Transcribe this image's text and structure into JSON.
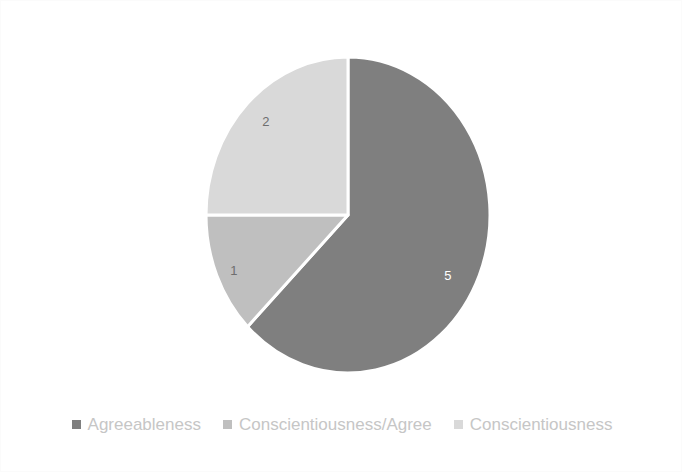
{
  "chart_data": {
    "type": "pie",
    "title": "",
    "categories": [
      "Agreeableness",
      "Conscientiousness/Agree",
      "Conscientiousness"
    ],
    "values": [
      5,
      1,
      2
    ],
    "labels": [
      "5",
      "1",
      "2"
    ],
    "total": 8,
    "start_angle_deg": 0,
    "direction": "clockwise",
    "slice_angles_deg": [
      225,
      45,
      90
    ],
    "colors": [
      "#7f7f7f",
      "#bfbfbf",
      "#d9d9d9"
    ],
    "label_text_colors": [
      "#ffffff",
      "#6e6e6e",
      "#6e6e6e"
    ],
    "slice_border_color": "#ffffff",
    "legend_position": "bottom",
    "grid": false,
    "background": "#ffffff"
  },
  "legend": {
    "items": [
      {
        "label": "Agreeableness",
        "color": "#7f7f7f"
      },
      {
        "label": "Conscientiousness/Agree",
        "color": "#bfbfbf"
      },
      {
        "label": "Conscientiousness",
        "color": "#d9d9d9"
      }
    ]
  },
  "pie_geometry": {
    "cx": 347,
    "cy": 214,
    "rx": 142,
    "ry": 158
  },
  "slice_labels": [
    {
      "text": "5",
      "x": 447,
      "y": 279,
      "tone": "light"
    },
    {
      "text": "1",
      "x": 233,
      "y": 274,
      "tone": "dark"
    },
    {
      "text": "2",
      "x": 265,
      "y": 125,
      "tone": "dark"
    }
  ]
}
